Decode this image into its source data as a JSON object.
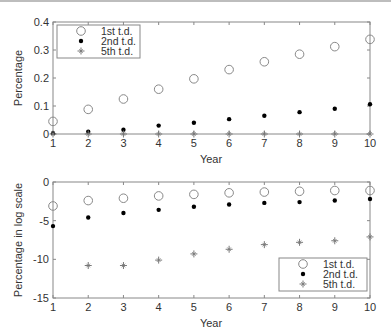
{
  "chart_data": [
    {
      "type": "scatter",
      "title": "",
      "xlabel": "Year",
      "ylabel": "Percentage",
      "x": [
        1,
        2,
        3,
        4,
        5,
        6,
        7,
        8,
        9,
        10
      ],
      "xlim": [
        1,
        10
      ],
      "ylim": [
        0,
        0.4
      ],
      "xticks": [
        "1",
        "2",
        "3",
        "4",
        "5",
        "6",
        "7",
        "8",
        "9",
        "10"
      ],
      "yticks": [
        "0",
        "0.1",
        "0.2",
        "0.3",
        "0.4"
      ],
      "grid": false,
      "legend_position": "upper left",
      "series": [
        {
          "name": "1st t.d.",
          "marker": "open-circle",
          "x": [
            1,
            2,
            3,
            4,
            5,
            6,
            7,
            8,
            9,
            10
          ],
          "values": [
            0.045,
            0.088,
            0.125,
            0.16,
            0.197,
            0.23,
            0.258,
            0.285,
            0.312,
            0.338
          ]
        },
        {
          "name": "2nd t.d.",
          "marker": "dot",
          "x": [
            1,
            2,
            3,
            4,
            5,
            6,
            7,
            8,
            9,
            10
          ],
          "values": [
            0.003,
            0.008,
            0.015,
            0.03,
            0.04,
            0.053,
            0.065,
            0.078,
            0.09,
            0.106
          ]
        },
        {
          "name": "5th t.d.",
          "marker": "star",
          "x": [
            1,
            2,
            3,
            4,
            5,
            6,
            7,
            8,
            9,
            10
          ],
          "values": [
            0,
            0,
            0,
            0,
            0,
            0,
            0,
            0,
            0,
            0
          ]
        }
      ]
    },
    {
      "type": "scatter",
      "title": "",
      "xlabel": "Year",
      "ylabel": "Percentage in log scale",
      "x": [
        1,
        2,
        3,
        4,
        5,
        6,
        7,
        8,
        9,
        10
      ],
      "xlim": [
        1,
        10
      ],
      "ylim": [
        -15,
        0
      ],
      "xticks": [
        "1",
        "2",
        "3",
        "4",
        "5",
        "6",
        "7",
        "8",
        "9",
        "10"
      ],
      "yticks": [
        "-15",
        "-10",
        "-5",
        "0"
      ],
      "grid": false,
      "legend_position": "lower right",
      "series": [
        {
          "name": "1st t.d.",
          "marker": "open-circle",
          "x": [
            1,
            2,
            3,
            4,
            5,
            6,
            7,
            8,
            9,
            10
          ],
          "values": [
            -3.1,
            -2.4,
            -2.1,
            -1.8,
            -1.6,
            -1.4,
            -1.3,
            -1.2,
            -1.1,
            -1.1
          ]
        },
        {
          "name": "2nd t.d.",
          "marker": "dot",
          "x": [
            1,
            2,
            3,
            4,
            5,
            6,
            7,
            8,
            9,
            10
          ],
          "values": [
            -5.7,
            -4.6,
            -4.0,
            -3.6,
            -3.2,
            -2.9,
            -2.7,
            -2.6,
            -2.4,
            -2.2
          ]
        },
        {
          "name": "5th t.d.",
          "marker": "star",
          "x": [
            2,
            3,
            4,
            5,
            6,
            7,
            8,
            9,
            10
          ],
          "values": [
            -10.8,
            -10.8,
            -10.1,
            -9.3,
            -8.7,
            -8.1,
            -7.8,
            -7.6,
            -7.1
          ]
        }
      ]
    }
  ],
  "colors": {
    "axis": "#888888",
    "circle": "#888888",
    "dot": "#000000",
    "star": "#777777",
    "text": "#333333"
  }
}
